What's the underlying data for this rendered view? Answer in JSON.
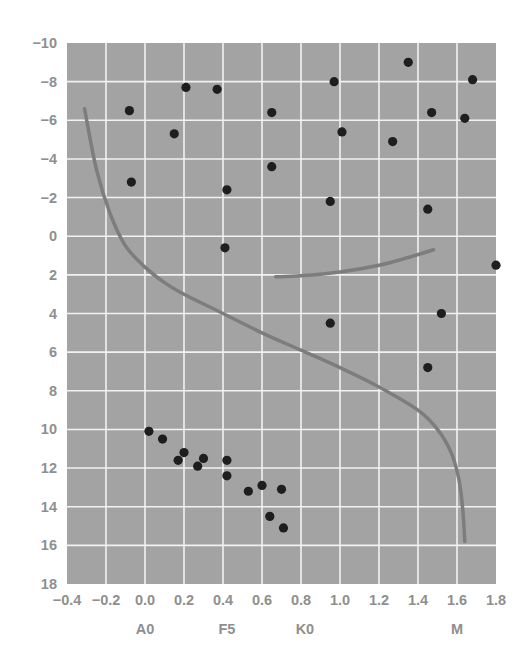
{
  "chart_data": {
    "type": "scatter",
    "title": "",
    "xlabel": "",
    "ylabel": "",
    "xlim": [
      -0.4,
      1.8
    ],
    "ylim": [
      18,
      -10
    ],
    "y_inverted": true,
    "grid": true,
    "legend": null,
    "x_ticks": [
      -0.4,
      -0.2,
      0.0,
      0.2,
      0.4,
      0.6,
      0.8,
      1.0,
      1.2,
      1.4,
      1.6,
      1.8
    ],
    "x_tick_labels": [
      "−0.4",
      "−0.2",
      "0.0",
      "0.2",
      "0.4",
      "0.6",
      "0.8",
      "1.0",
      "1.2",
      "1.4",
      "1.6",
      "1.8"
    ],
    "y_ticks": [
      -10,
      -8,
      -6,
      -4,
      -2,
      0,
      2,
      4,
      6,
      8,
      10,
      12,
      14,
      16,
      18
    ],
    "y_tick_labels": [
      "−10",
      "−8",
      "−6",
      "−4",
      "−2",
      "0",
      "2",
      "4",
      "6",
      "8",
      "10",
      "12",
      "14",
      "16",
      "18"
    ],
    "spectral_class_labels": [
      {
        "label": "A0",
        "x": 0.0
      },
      {
        "label": "F5",
        "x": 0.42
      },
      {
        "label": "K0",
        "x": 0.82
      },
      {
        "label": "M",
        "x": 1.6
      }
    ],
    "series": [
      {
        "name": "stars",
        "type": "scatter",
        "points": [
          {
            "x": -0.08,
            "y": -6.5
          },
          {
            "x": -0.07,
            "y": -2.8
          },
          {
            "x": 0.15,
            "y": -5.3
          },
          {
            "x": 0.21,
            "y": -7.7
          },
          {
            "x": 0.37,
            "y": -7.6
          },
          {
            "x": 0.42,
            "y": -2.4
          },
          {
            "x": 0.41,
            "y": 0.6
          },
          {
            "x": 0.65,
            "y": -6.4
          },
          {
            "x": 0.65,
            "y": -3.6
          },
          {
            "x": 0.97,
            "y": -8.0
          },
          {
            "x": 1.01,
            "y": -5.4
          },
          {
            "x": 0.95,
            "y": -1.8
          },
          {
            "x": 1.27,
            "y": -4.9
          },
          {
            "x": 1.35,
            "y": -9.0
          },
          {
            "x": 1.47,
            "y": -6.4
          },
          {
            "x": 1.45,
            "y": -1.4
          },
          {
            "x": 1.64,
            "y": -6.1
          },
          {
            "x": 1.68,
            "y": -8.1
          },
          {
            "x": 1.8,
            "y": 1.5
          },
          {
            "x": 1.52,
            "y": 4.0
          },
          {
            "x": 1.45,
            "y": 6.8
          },
          {
            "x": 0.95,
            "y": 4.5
          },
          {
            "x": 0.02,
            "y": 10.1
          },
          {
            "x": 0.09,
            "y": 10.5
          },
          {
            "x": 0.2,
            "y": 11.2
          },
          {
            "x": 0.17,
            "y": 11.6
          },
          {
            "x": 0.27,
            "y": 11.9
          },
          {
            "x": 0.3,
            "y": 11.5
          },
          {
            "x": 0.42,
            "y": 11.6
          },
          {
            "x": 0.42,
            "y": 12.4
          },
          {
            "x": 0.53,
            "y": 13.2
          },
          {
            "x": 0.6,
            "y": 12.9
          },
          {
            "x": 0.7,
            "y": 13.1
          },
          {
            "x": 0.64,
            "y": 14.5
          },
          {
            "x": 0.71,
            "y": 15.1
          }
        ]
      },
      {
        "name": "main-sequence",
        "type": "line",
        "points": [
          {
            "x": -0.31,
            "y": -6.6
          },
          {
            "x": -0.25,
            "y": -3.5
          },
          {
            "x": -0.18,
            "y": -1.2
          },
          {
            "x": -0.1,
            "y": 0.5
          },
          {
            "x": 0.0,
            "y": 1.6
          },
          {
            "x": 0.1,
            "y": 2.4
          },
          {
            "x": 0.2,
            "y": 3.0
          },
          {
            "x": 0.4,
            "y": 4.0
          },
          {
            "x": 0.6,
            "y": 5.0
          },
          {
            "x": 0.8,
            "y": 5.9
          },
          {
            "x": 1.0,
            "y": 6.8
          },
          {
            "x": 1.2,
            "y": 7.8
          },
          {
            "x": 1.4,
            "y": 9.0
          },
          {
            "x": 1.5,
            "y": 10.0
          },
          {
            "x": 1.57,
            "y": 11.2
          },
          {
            "x": 1.61,
            "y": 12.6
          },
          {
            "x": 1.63,
            "y": 14.2
          },
          {
            "x": 1.64,
            "y": 15.8
          }
        ]
      },
      {
        "name": "giant-branch",
        "type": "line",
        "points": [
          {
            "x": 0.67,
            "y": 2.1
          },
          {
            "x": 0.8,
            "y": 2.05
          },
          {
            "x": 1.0,
            "y": 1.85
          },
          {
            "x": 1.2,
            "y": 1.5
          },
          {
            "x": 1.35,
            "y": 1.1
          },
          {
            "x": 1.48,
            "y": 0.7
          }
        ]
      }
    ],
    "colors": {
      "plot_background": "#a3a3a3",
      "grid": "#f2f2f2",
      "points": "#1e1e1e",
      "curves": "#7d7d7d",
      "tick_labels": "#8f8f8f"
    }
  }
}
